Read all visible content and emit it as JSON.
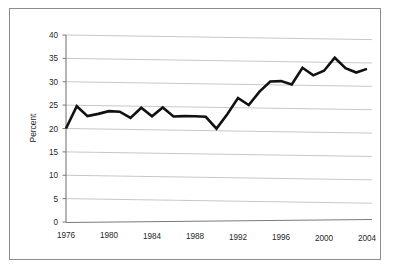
{
  "chart_data": {
    "type": "line",
    "title": "",
    "xlabel": "",
    "ylabel": "Percent",
    "xlim": [
      1976,
      2004
    ],
    "ylim": [
      0,
      40
    ],
    "grid": true,
    "legend": "none",
    "ytick_labels": [
      "0",
      "5",
      "10",
      "15",
      "20",
      "25",
      "30",
      "35",
      "40"
    ],
    "ytick_values": [
      0,
      5,
      10,
      15,
      20,
      25,
      30,
      35,
      40
    ],
    "xtick_labels": [
      "1976",
      "1980",
      "1984",
      "1988",
      "1992",
      "1996",
      "2000",
      "2004"
    ],
    "xtick_values": [
      1976,
      1980,
      1984,
      1988,
      1992,
      1996,
      2000,
      2004
    ],
    "x": [
      1976,
      1977,
      1978,
      1979,
      1980,
      1981,
      1982,
      1983,
      1984,
      1985,
      1986,
      1987,
      1988,
      1989,
      1990,
      1991,
      1992,
      1993,
      1994,
      1995,
      1996,
      1997,
      1998,
      1999,
      2000,
      2001,
      2002,
      2003,
      2004
    ],
    "values": [
      20.0,
      24.8,
      22.7,
      23.2,
      23.8,
      23.7,
      22.4,
      24.6,
      22.8,
      24.7,
      22.8,
      22.9,
      22.9,
      22.8,
      20.3,
      23.4,
      26.9,
      25.4,
      28.3,
      30.5,
      30.6,
      29.9,
      33.5,
      31.9,
      32.9,
      35.7,
      33.5,
      32.6,
      33.4
    ],
    "series_name": "Percent",
    "line_color": "#111111",
    "grid_color": "#b9b9b9",
    "axis_color": "#7a7a7a",
    "background_color": "#ffffff"
  },
  "figure": {
    "frame_label": "chart-frame"
  }
}
